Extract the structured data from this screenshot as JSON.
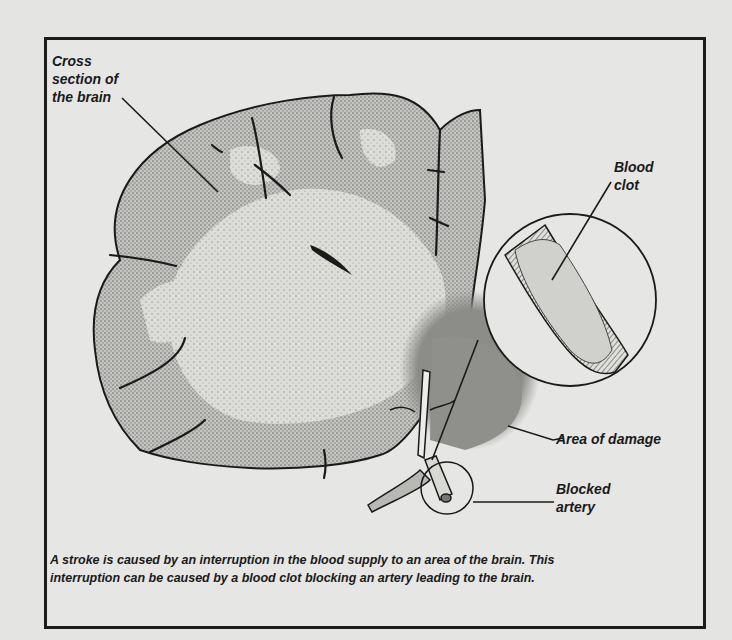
{
  "figure": {
    "labels": {
      "cross_section": [
        "Cross",
        "section of",
        "the brain"
      ],
      "blood_clot": [
        "Blood",
        "clot"
      ],
      "area_of_damage": "Area of damage",
      "blocked_artery": [
        "Blocked",
        "artery"
      ]
    },
    "caption": {
      "line1": "A stroke is caused by an interruption in the blood supply to an area of the brain. This",
      "line2": "interruption can be caused by a blood clot blocking an artery leading to the brain."
    },
    "colors": {
      "background": "#e4e4e2",
      "frame": "#1c1c1c",
      "gray_matter": "#b9b9b6",
      "white_matter": "#d6d6d3",
      "damage": "#8f8f8c",
      "ink": "#1a1a1a"
    }
  }
}
